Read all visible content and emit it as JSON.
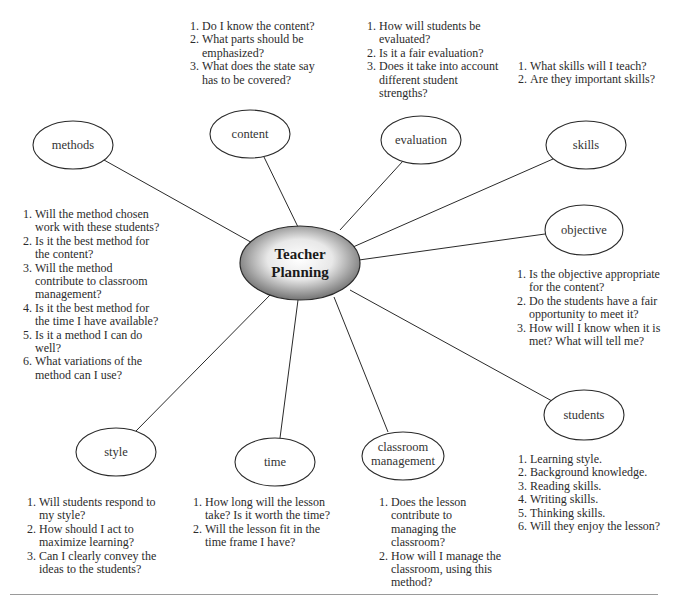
{
  "diagram": {
    "center": {
      "label_line1": "Teacher",
      "label_line2": "Planning"
    },
    "nodes": {
      "methods": {
        "label": "methods"
      },
      "content": {
        "label": "content"
      },
      "evaluation": {
        "label": "evaluation"
      },
      "skills": {
        "label": "skills"
      },
      "objective": {
        "label": "objective"
      },
      "students": {
        "label": "students"
      },
      "classroom_management": {
        "label_line1": "classroom",
        "label_line2": "management"
      },
      "time": {
        "label": "time"
      },
      "style": {
        "label": "style"
      }
    },
    "questions": {
      "content": [
        {
          "n": "1.",
          "text": "Do I know the content?"
        },
        {
          "n": "2.",
          "text": "What parts should be emphasized?"
        },
        {
          "n": "3.",
          "text": "What does the state say has to be covered?"
        }
      ],
      "evaluation": [
        {
          "n": "1.",
          "text": "How will students be evaluated?"
        },
        {
          "n": "2.",
          "text": "Is it a fair evaluation?"
        },
        {
          "n": "3.",
          "text": "Does it take into account different student strengths?"
        }
      ],
      "skills": [
        {
          "n": "1.",
          "text": "What skills will I teach?"
        },
        {
          "n": "2.",
          "text": "Are they important skills?"
        }
      ],
      "methods": [
        {
          "n": "1.",
          "text": "Will the method chosen work with these students?"
        },
        {
          "n": "2.",
          "text": "Is it the best method for the content?"
        },
        {
          "n": "3.",
          "text": "Will the method contribute to classroom management?"
        },
        {
          "n": "4.",
          "text": "Is it the best method for the time I have available?"
        },
        {
          "n": "5.",
          "text": "Is it a method I can do well?"
        },
        {
          "n": "6.",
          "text": "What variations of the method can I use?"
        }
      ],
      "objective": [
        {
          "n": "1.",
          "text": "Is the objective appropriate for the content?"
        },
        {
          "n": "2.",
          "text": "Do the students have a fair opportunity to meet it?"
        },
        {
          "n": "3.",
          "text": "How will I know when it is met? What will tell me?"
        }
      ],
      "style": [
        {
          "n": "1.",
          "text": "Will students respond to my style?"
        },
        {
          "n": "2.",
          "text": "How should I act to maximize learning?"
        },
        {
          "n": "3.",
          "text": "Can I clearly convey the ideas to the students?"
        }
      ],
      "time": [
        {
          "n": "1.",
          "text": "How long will the lesson take? Is it worth the time?"
        },
        {
          "n": "2.",
          "text": "Will the lesson fit in the time frame I have?"
        }
      ],
      "classroom_management": [
        {
          "n": "1.",
          "text": "Does the lesson contribute to managing the classroom?"
        },
        {
          "n": "2.",
          "text": "How will I manage the classroom, using this method?"
        }
      ],
      "students": [
        {
          "n": "1.",
          "text": "Learning style."
        },
        {
          "n": "2.",
          "text": "Background knowledge."
        },
        {
          "n": "3.",
          "text": "Reading skills."
        },
        {
          "n": "4.",
          "text": "Writing skills."
        },
        {
          "n": "5.",
          "text": "Thinking skills."
        },
        {
          "n": "6.",
          "text": "Will they enjoy the lesson?"
        }
      ]
    }
  },
  "colors": {
    "stroke": "#2a2a2a",
    "center_dark": "#5a5a5a",
    "center_light": "#ffffff",
    "divider": "#9a9a9a"
  }
}
